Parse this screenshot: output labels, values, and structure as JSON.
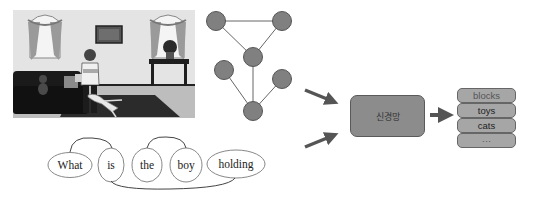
{
  "figure": {
    "colors": {
      "node_fill": "#808080",
      "node_stroke": "#555555",
      "edge": "#666666",
      "arrow": "#555555",
      "nn_box_fill": "#8c8c8c",
      "answer_fill": "#a6a6a6"
    }
  },
  "scene": {
    "label": "room-scene-image"
  },
  "graph": {
    "nodes": [
      {
        "id": 1,
        "x": 216,
        "y": 21
      },
      {
        "id": 2,
        "x": 282,
        "y": 21
      },
      {
        "id": 3,
        "x": 253,
        "y": 57
      },
      {
        "id": 4,
        "x": 224,
        "y": 70
      },
      {
        "id": 5,
        "x": 282,
        "y": 79
      },
      {
        "id": 6,
        "x": 253,
        "y": 111
      }
    ],
    "edges": [
      [
        1,
        2
      ],
      [
        1,
        3
      ],
      [
        2,
        3
      ],
      [
        3,
        6
      ],
      [
        4,
        6
      ],
      [
        5,
        6
      ]
    ]
  },
  "question": {
    "words": [
      "What",
      "is",
      "the",
      "boy",
      "holding"
    ]
  },
  "model": {
    "label": "신경망"
  },
  "answers": {
    "items": [
      "blocks",
      "toys",
      "cats",
      "···"
    ]
  }
}
